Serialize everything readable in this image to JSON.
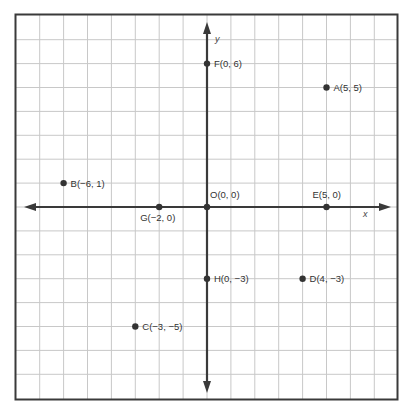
{
  "chart_data": {
    "type": "scatter",
    "title": "",
    "xlabel": "x",
    "ylabel": "y",
    "xlim": [
      -8,
      8
    ],
    "ylim": [
      -8,
      8
    ],
    "grid": true,
    "grid_step": 1,
    "points": [
      {
        "name": "A",
        "x": 5,
        "y": 5,
        "label": "A(5, 5)"
      },
      {
        "name": "B",
        "x": -6,
        "y": 1,
        "label": "B(−6, 1)"
      },
      {
        "name": "C",
        "x": -3,
        "y": -5,
        "label": "C(−3, −5)"
      },
      {
        "name": "D",
        "x": 4,
        "y": -3,
        "label": "D(4, −3)"
      },
      {
        "name": "E",
        "x": 5,
        "y": 0,
        "label": "E(5, 0)"
      },
      {
        "name": "F",
        "x": 0,
        "y": 6,
        "label": "F(0, 6)"
      },
      {
        "name": "G",
        "x": -2,
        "y": 0,
        "label": "G(−2, 0)"
      },
      {
        "name": "H",
        "x": 0,
        "y": -3,
        "label": "H(0, −3)"
      },
      {
        "name": "O",
        "x": 0,
        "y": 0,
        "label": "O(0, 0)"
      }
    ]
  },
  "colors": {
    "grid": "#c8c8c8",
    "axis": "#3a3a3a",
    "border": "#3a3a3a",
    "point": "#333333"
  }
}
